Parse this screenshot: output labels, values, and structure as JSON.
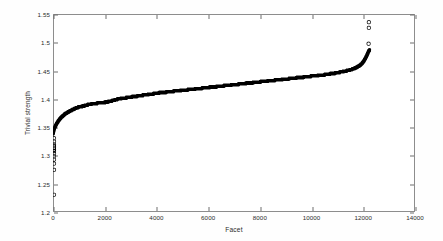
{
  "chart_data": {
    "type": "scatter",
    "title": "",
    "xlabel": "Facet",
    "ylabel": "Trivial strength",
    "xlim": [
      0,
      14000
    ],
    "ylim": [
      1.2,
      1.55
    ],
    "xticks": [
      0,
      2000,
      4000,
      6000,
      8000,
      10000,
      12000,
      14000
    ],
    "yticks": [
      1.2,
      1.25,
      1.3,
      1.35,
      1.4,
      1.45,
      1.5,
      1.55
    ],
    "xtick_labels": [
      "0",
      "2000",
      "4000",
      "6000",
      "8000",
      "10000",
      "12000",
      "14000"
    ],
    "ytick_labels": [
      "1.2",
      "1.25",
      "1.3",
      "1.35",
      "1.4",
      "1.45",
      "1.5",
      "1.55"
    ],
    "grid": false,
    "legend": null,
    "marker": "circle",
    "marker_color": "#000000",
    "marker_size": 1.6,
    "n_points": 12250,
    "series": [
      {
        "name": "sorted trivial strength",
        "x": [
          5,
          15,
          30,
          50,
          75,
          105,
          140,
          180,
          225,
          275,
          330,
          390,
          455,
          525,
          600,
          680,
          765,
          855,
          950,
          1050,
          1150,
          1260,
          1380,
          1500,
          1630,
          1760,
          1900,
          2040,
          2180,
          2320,
          2460,
          2600,
          2750,
          2900,
          3050,
          3200,
          3350,
          3500,
          3650,
          3800,
          3950,
          4100,
          4250,
          4400,
          4550,
          4700,
          4850,
          5000,
          5150,
          5300,
          5450,
          5600,
          5750,
          5900,
          6050,
          6200,
          6350,
          6500,
          6650,
          6800,
          6950,
          7100,
          7250,
          7400,
          7550,
          7700,
          7850,
          8000,
          8150,
          8300,
          8450,
          8600,
          8750,
          8900,
          9050,
          9200,
          9350,
          9500,
          9650,
          9800,
          9950,
          10100,
          10250,
          10400,
          10550,
          10700,
          10850,
          11000,
          11150,
          11300,
          11450,
          11600,
          11720,
          11830,
          11930,
          12010,
          12080,
          12140,
          12185,
          12215,
          12240
        ],
        "y": [
          1.338,
          1.341,
          1.344,
          1.347,
          1.35,
          1.353,
          1.356,
          1.359,
          1.362,
          1.365,
          1.368,
          1.37,
          1.373,
          1.375,
          1.377,
          1.379,
          1.381,
          1.383,
          1.385,
          1.386,
          1.387,
          1.3885,
          1.39,
          1.391,
          1.392,
          1.3925,
          1.393,
          1.394,
          1.3955,
          1.397,
          1.399,
          1.4005,
          1.4015,
          1.4025,
          1.4035,
          1.4045,
          1.4055,
          1.4065,
          1.4075,
          1.4085,
          1.4095,
          1.4105,
          1.4112,
          1.412,
          1.4128,
          1.4135,
          1.4143,
          1.415,
          1.4158,
          1.4165,
          1.4173,
          1.418,
          1.4188,
          1.4195,
          1.4203,
          1.421,
          1.4218,
          1.4225,
          1.4233,
          1.424,
          1.4248,
          1.4255,
          1.4263,
          1.427,
          1.4278,
          1.4285,
          1.4293,
          1.43,
          1.4308,
          1.4315,
          1.4323,
          1.433,
          1.4338,
          1.4345,
          1.4353,
          1.436,
          1.4368,
          1.4375,
          1.4383,
          1.439,
          1.4398,
          1.4405,
          1.4413,
          1.442,
          1.443,
          1.444,
          1.445,
          1.4462,
          1.4475,
          1.449,
          1.4508,
          1.4528,
          1.4552,
          1.458,
          1.4615,
          1.466,
          1.4715,
          1.477,
          1.4818,
          1.4848,
          1.4862
        ]
      }
    ],
    "outliers_high": [
      {
        "x": 12215,
        "y": 1.5355
      },
      {
        "x": 12215,
        "y": 1.5255
      },
      {
        "x": 12205,
        "y": 1.4975
      }
    ],
    "outliers_low": [
      {
        "x": 40,
        "y": 1.3305
      },
      {
        "x": 40,
        "y": 1.3245
      },
      {
        "x": 40,
        "y": 1.3195
      },
      {
        "x": 40,
        "y": 1.3165
      },
      {
        "x": 40,
        "y": 1.3135
      },
      {
        "x": 40,
        "y": 1.3105
      },
      {
        "x": 40,
        "y": 1.3075
      },
      {
        "x": 40,
        "y": 1.3035
      },
      {
        "x": 40,
        "y": 1.2985
      },
      {
        "x": 40,
        "y": 1.2925
      },
      {
        "x": 40,
        "y": 1.2855
      },
      {
        "x": 40,
        "y": 1.2745
      },
      {
        "x": 40,
        "y": 1.2305
      }
    ]
  }
}
